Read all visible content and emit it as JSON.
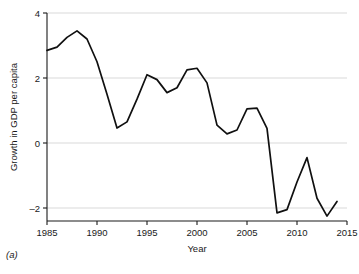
{
  "figure": {
    "panel_caption": "(a)",
    "background_color": "#ffffff",
    "line_color": "#101010",
    "grid_color": "#cfcfcf"
  },
  "chart_data": {
    "type": "line",
    "title": "",
    "xlabel": "Year",
    "ylabel": "Growth in GDP per capita",
    "xlim": [
      1985,
      2015
    ],
    "ylim": [
      -2.6,
      4.0
    ],
    "xticks": [
      1985,
      1990,
      1995,
      2000,
      2005,
      2010,
      2015
    ],
    "xtick_labels": [
      "1985",
      "1990",
      "1995",
      "2000",
      "2005",
      "2010",
      "2015"
    ],
    "yticks": [
      4,
      2,
      0,
      -2
    ],
    "ytick_labels": [
      "4",
      "2",
      "0",
      "–2"
    ],
    "grid": "horizontal",
    "legend": "none",
    "x": [
      1985,
      1986,
      1987,
      1988,
      1989,
      1990,
      1991,
      1992,
      1993,
      1994,
      1995,
      1996,
      1997,
      1998,
      1999,
      2000,
      2001,
      2002,
      2003,
      2004,
      2005,
      2006,
      2007,
      2008,
      2009,
      2010,
      2011,
      2012,
      2013,
      2014
    ],
    "values": [
      2.85,
      2.95,
      3.25,
      3.45,
      3.2,
      2.5,
      1.5,
      0.46,
      0.65,
      1.35,
      2.1,
      1.95,
      1.55,
      1.7,
      2.25,
      2.3,
      1.85,
      0.55,
      0.28,
      0.4,
      1.05,
      1.07,
      0.45,
      -2.15,
      -2.05,
      -1.2,
      -0.45,
      -1.7,
      -2.25,
      -1.8
    ],
    "series": [
      {
        "name": "Growth in GDP per capita",
        "values": [
          2.85,
          2.95,
          3.25,
          3.45,
          3.2,
          2.5,
          1.5,
          0.46,
          0.65,
          1.35,
          2.1,
          1.95,
          1.55,
          1.7,
          2.25,
          2.3,
          1.85,
          0.55,
          0.28,
          0.4,
          1.05,
          1.07,
          0.45,
          -2.15,
          -2.05,
          -1.2,
          -0.45,
          -1.7,
          -2.25,
          -1.8
        ]
      }
    ]
  }
}
